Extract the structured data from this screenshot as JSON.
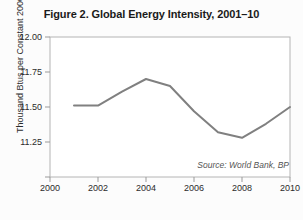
{
  "chart_data": {
    "type": "line",
    "title": "Figure 2. Global Energy Intensity, 2001–10",
    "xlabel": "",
    "ylabel": "Thousand Btus per Constant 2000 Dollar",
    "source": "Source: World Bank, BP",
    "xlim": [
      2000,
      2010
    ],
    "ylim": [
      11.0,
      12.0
    ],
    "xticks": [
      2000,
      2002,
      2004,
      2006,
      2008,
      2010
    ],
    "xtick_labels": [
      "2000",
      "2002",
      "2004",
      "2006",
      "2008",
      "2010"
    ],
    "yticks": [
      11.0,
      11.25,
      11.5,
      11.75,
      12.0
    ],
    "ytick_labels": [
      "",
      "11.25",
      "11.50",
      "11.75",
      "12.00"
    ],
    "grid": false,
    "legend": "none",
    "line_color": "#808080",
    "line_width": 2,
    "x": [
      2001,
      2002,
      2003,
      2004,
      2005,
      2006,
      2007,
      2008,
      2009,
      2010
    ],
    "values": [
      11.51,
      11.51,
      11.61,
      11.7,
      11.65,
      11.47,
      11.32,
      11.28,
      11.38,
      11.5
    ],
    "series": [
      {
        "name": "Global Energy Intensity",
        "values": [
          11.51,
          11.51,
          11.61,
          11.7,
          11.65,
          11.47,
          11.32,
          11.28,
          11.38,
          11.5
        ]
      }
    ]
  }
}
